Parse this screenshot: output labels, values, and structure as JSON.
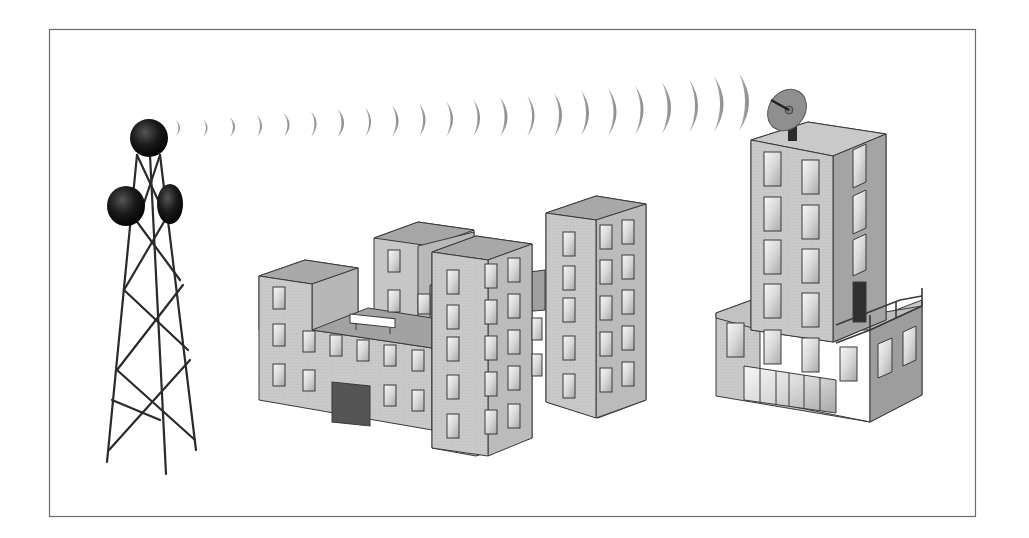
{
  "diagram": {
    "type": "wireless-link-illustration",
    "description_labels": [],
    "elements": {
      "frame": {
        "x": 49,
        "y": 29,
        "width": 926,
        "height": 487,
        "stroke": "#6b6b6b"
      },
      "tower": {
        "name": "transmission-tower",
        "antennas": 3,
        "antenna_color": "#111111"
      },
      "signal_waves": {
        "count": 22,
        "color": "#9a9a9a",
        "from": [
          175,
          128
        ],
        "to": [
          755,
          90
        ]
      },
      "building_complex": {
        "name": "office-building-complex",
        "blocks": 4,
        "face_color": "#c8c8c8",
        "roof_color": "#a9a9a9",
        "side_color": "#b5b5b5"
      },
      "receiver_building": {
        "name": "receiver-building",
        "dish": true,
        "dish_color": "#8f8f8f"
      }
    },
    "colors": {
      "background": "#ffffff",
      "outline": "#3a3a3a",
      "window_glass": "#e9e9e9",
      "door": "#555555"
    }
  }
}
